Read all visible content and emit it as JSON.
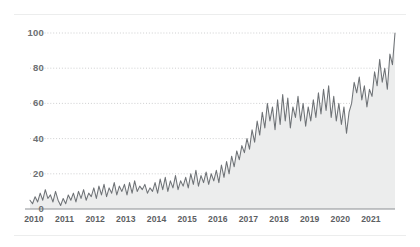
{
  "chart_data": {
    "type": "line",
    "title": "",
    "subtitle": "",
    "xlabel": "",
    "ylabel": "",
    "ylim": [
      0,
      105
    ],
    "yticks": [
      0,
      20,
      40,
      60,
      80,
      100
    ],
    "grid": "horizontal-dotted",
    "legend": "none",
    "fill": "area-below-line",
    "x_tick_labels": [
      "2010",
      "2011",
      "2012",
      "2013",
      "2014",
      "2015",
      "2016",
      "2017",
      "2018",
      "2019",
      "2020",
      "2021"
    ],
    "x_start": "2010",
    "x_end": "2021",
    "x_frequency": "monthly",
    "colors": {
      "line": "#6e7276",
      "area": "#eceded",
      "gridline": "#c9cbcc",
      "axis": "#8c9094",
      "tick_label": "#5d6063",
      "background": "#ffffff",
      "rule": "#eceded"
    },
    "series": [
      {
        "name": "value",
        "values": [
          5,
          3,
          7,
          4,
          9,
          5,
          11,
          6,
          8,
          4,
          10,
          5,
          2,
          6,
          3,
          8,
          5,
          9,
          4,
          10,
          6,
          11,
          5,
          9,
          7,
          12,
          6,
          13,
          8,
          14,
          7,
          12,
          9,
          15,
          8,
          13,
          10,
          14,
          8,
          15,
          9,
          16,
          10,
          13,
          11,
          14,
          9,
          12,
          10,
          15,
          9,
          17,
          11,
          18,
          10,
          16,
          12,
          19,
          11,
          16,
          13,
          18,
          12,
          20,
          14,
          22,
          13,
          19,
          15,
          21,
          14,
          20,
          16,
          22,
          15,
          25,
          18,
          27,
          20,
          30,
          24,
          33,
          28,
          36,
          32,
          40,
          34,
          45,
          38,
          50,
          42,
          55,
          46,
          60,
          50,
          58,
          45,
          62,
          48,
          65,
          50,
          63,
          46,
          58,
          52,
          64,
          50,
          60,
          47,
          58,
          50,
          62,
          52,
          66,
          54,
          68,
          56,
          70,
          52,
          64,
          50,
          60,
          48,
          58,
          43,
          55,
          60,
          72,
          66,
          75,
          62,
          70,
          58,
          68,
          64,
          78,
          70,
          85,
          72,
          80,
          68,
          88,
          82,
          100
        ]
      }
    ]
  },
  "axis": {
    "y_ticks": [
      "100",
      "80",
      "60",
      "40",
      "20",
      "0"
    ],
    "x_ticks": [
      "2010",
      "2011",
      "2012",
      "2013",
      "2014",
      "2015",
      "2016",
      "2017",
      "2018",
      "2019",
      "2020",
      "2021"
    ]
  }
}
